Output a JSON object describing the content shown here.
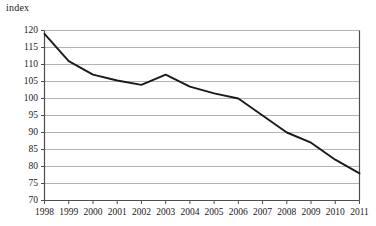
{
  "chart_data": {
    "type": "line",
    "title": "",
    "subtitle": "",
    "xlabel": "",
    "ylabel": "index",
    "ylabel_position": "top-left",
    "grid": "horizontal",
    "legend": "none",
    "ylim": [
      70,
      120
    ],
    "ytick_step": 5,
    "yticks": [
      120,
      115,
      110,
      105,
      100,
      95,
      90,
      85,
      80,
      75,
      70
    ],
    "categories": [
      "1998",
      "1999",
      "2000",
      "2001",
      "2002",
      "2003",
      "2004",
      "2005",
      "2006",
      "2007",
      "2008",
      "2009",
      "2010",
      "2011"
    ],
    "x": [
      1998,
      1999,
      2000,
      2001,
      2002,
      2003,
      2004,
      2005,
      2006,
      2007,
      2008,
      2009,
      2010,
      2011
    ],
    "values": [
      119,
      111,
      107,
      105.3,
      104,
      107,
      103.5,
      101.5,
      100,
      95,
      90,
      87,
      82,
      78
    ],
    "series": [
      {
        "name": "index",
        "values": [
          119,
          111,
          107,
          105.3,
          104,
          107,
          103.5,
          101.5,
          100,
          95,
          90,
          87,
          82,
          78
        ]
      }
    ],
    "annotations": []
  },
  "style": {
    "line_color": "#1a1a1a",
    "grid_color": "#b3b3b3",
    "frame_color": "#4d4d4d",
    "background": "#ffffff",
    "tick_color": "#4d4d4d"
  }
}
